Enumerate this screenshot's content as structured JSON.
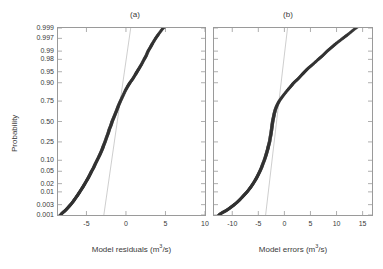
{
  "figure": {
    "background": "#ffffff",
    "axis_color": "#9a9a9a",
    "marker_color": "#333333",
    "refline_color": "#b9b9b9"
  },
  "ylabel": "Probability",
  "probability_ticks": [
    "0.999",
    "0.997",
    "0.99",
    "0.98",
    "0.95",
    "0.90",
    "0.75",
    "0.50",
    "0.25",
    "0.10",
    "0.05",
    "0.02",
    "0.01",
    "0.003",
    "0.001"
  ],
  "chart_data": [
    {
      "type": "scatter",
      "title": "(a)",
      "xlabel": "Model residuals (m3/s)",
      "xlabel_parts": {
        "text": "Model residuals (m",
        "sup": "3",
        "tail": "/s)"
      },
      "ylabel": "Probability",
      "xticks": [
        -5,
        0,
        5,
        10
      ],
      "xticklabels": [
        "-5",
        "0",
        "5",
        "10"
      ],
      "xlim": [
        -8.6,
        10.0
      ],
      "ylim_prob": [
        0.0008,
        0.9995
      ],
      "grid": false,
      "legend": null,
      "reference_line": {
        "x_at_p0.5": -1.0,
        "slope_note": "normal fit line",
        "x_at_p0.001": -2.8,
        "x_at_p0.999": 0.6
      },
      "points": {
        "probability": [
          0.001,
          0.0013,
          0.0016,
          0.002,
          0.0025,
          0.003,
          0.004,
          0.005,
          0.0065,
          0.008,
          0.01,
          0.013,
          0.016,
          0.02,
          0.026,
          0.032,
          0.04,
          0.05,
          0.063,
          0.079,
          0.1,
          0.125,
          0.15,
          0.18,
          0.21,
          0.25,
          0.3,
          0.35,
          0.4,
          0.45,
          0.5,
          0.55,
          0.6,
          0.65,
          0.7,
          0.75,
          0.8,
          0.85,
          0.88,
          0.9,
          0.92,
          0.94,
          0.95,
          0.96,
          0.97,
          0.98,
          0.985,
          0.99,
          0.993,
          0.995,
          0.997,
          0.998,
          0.999,
          0.9994,
          0.9996
        ],
        "x": [
          -8.3,
          -8.0,
          -7.7,
          -7.45,
          -7.2,
          -7.0,
          -6.7,
          -6.5,
          -6.25,
          -6.05,
          -5.85,
          -5.6,
          -5.4,
          -5.2,
          -4.95,
          -4.75,
          -4.55,
          -4.35,
          -4.1,
          -3.9,
          -3.65,
          -3.4,
          -3.2,
          -3.0,
          -2.85,
          -2.65,
          -2.45,
          -2.25,
          -2.1,
          -1.9,
          -1.75,
          -1.55,
          -1.35,
          -1.15,
          -0.95,
          -0.7,
          -0.4,
          -0.05,
          0.25,
          0.5,
          0.85,
          1.2,
          1.4,
          1.65,
          1.95,
          2.3,
          2.55,
          2.8,
          3.1,
          3.35,
          3.75,
          4.1,
          4.7,
          5.6,
          6.4
        ]
      }
    },
    {
      "type": "scatter",
      "title": "(b)",
      "xlabel": "Model errors (m3/s)",
      "xlabel_parts": {
        "text": "Model errors (m",
        "sup": "3",
        "tail": "/s)"
      },
      "ylabel": "Probability",
      "xticks": [
        -10,
        -5,
        0,
        5,
        10,
        15
      ],
      "xticklabels": [
        "-10",
        "-5",
        "0",
        "5",
        "10",
        "15"
      ],
      "xlim": [
        -13.5,
        16.8
      ],
      "ylim_prob": [
        0.0008,
        0.9995
      ],
      "grid": false,
      "legend": null,
      "reference_line": {
        "x_at_p0.5": -1.6,
        "slope_note": "normal fit line",
        "x_at_p0.001": -3.6,
        "x_at_p0.999": 0.6
      },
      "points": {
        "probability": [
          0.001,
          0.0013,
          0.0016,
          0.002,
          0.0025,
          0.003,
          0.004,
          0.005,
          0.0065,
          0.008,
          0.01,
          0.013,
          0.016,
          0.02,
          0.026,
          0.032,
          0.04,
          0.05,
          0.063,
          0.079,
          0.1,
          0.125,
          0.15,
          0.18,
          0.21,
          0.25,
          0.3,
          0.35,
          0.4,
          0.45,
          0.5,
          0.55,
          0.6,
          0.65,
          0.7,
          0.75,
          0.8,
          0.85,
          0.88,
          0.9,
          0.92,
          0.94,
          0.95,
          0.96,
          0.97,
          0.98,
          0.985,
          0.99,
          0.993,
          0.995,
          0.997,
          0.998,
          0.999,
          0.9994,
          0.9996
        ],
        "x": [
          -12.6,
          -11.9,
          -11.2,
          -10.6,
          -10.05,
          -9.6,
          -8.95,
          -8.5,
          -8.0,
          -7.6,
          -7.15,
          -6.7,
          -6.35,
          -6.0,
          -5.6,
          -5.3,
          -5.0,
          -4.7,
          -4.4,
          -4.15,
          -3.85,
          -3.6,
          -3.4,
          -3.2,
          -3.05,
          -2.85,
          -2.7,
          -2.55,
          -2.45,
          -2.35,
          -2.25,
          -2.1,
          -1.95,
          -1.75,
          -1.45,
          -1.0,
          -0.3,
          0.6,
          1.3,
          1.8,
          2.6,
          3.4,
          3.9,
          4.5,
          5.4,
          6.5,
          7.3,
          8.2,
          9.1,
          9.9,
          11.2,
          12.2,
          13.7,
          15.0,
          16.1
        ]
      }
    }
  ]
}
